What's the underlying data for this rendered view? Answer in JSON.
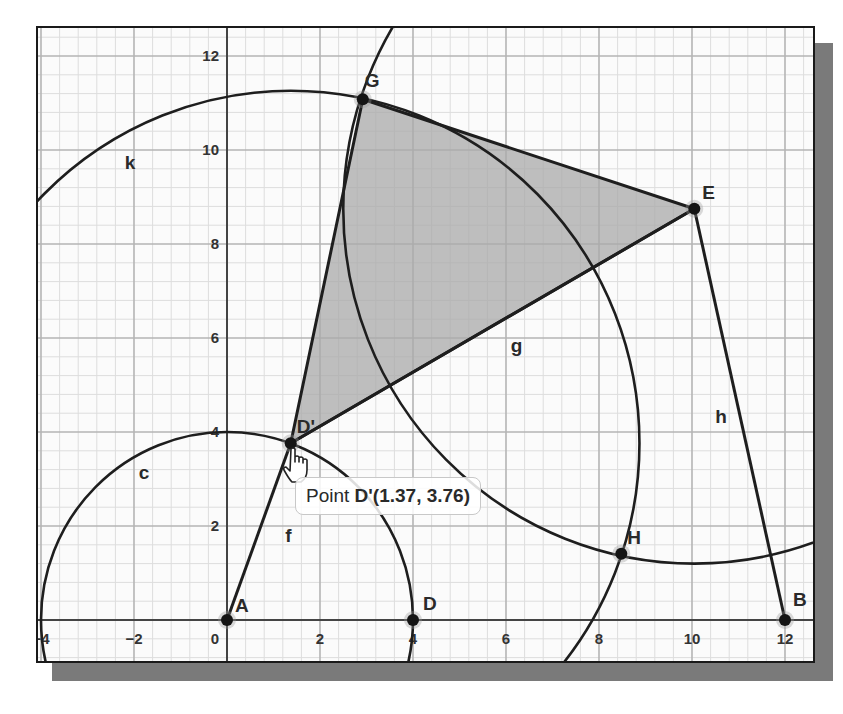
{
  "view": {
    "origin_px": [
      189,
      592
    ],
    "scale_x": 46.5,
    "scale_y": 47,
    "major_step": 2,
    "minor_step": 0.4,
    "x_ticks": [
      "-4",
      "-2",
      "0",
      "2",
      "4",
      "6",
      "8",
      "10",
      "12"
    ],
    "y_ticks": [
      "2",
      "4",
      "6",
      "8",
      "10",
      "12"
    ]
  },
  "colors": {
    "frame": "#1a1a1a",
    "shadow": "#7a7a7a",
    "grid_major": "#b5b5b5",
    "grid_minor": "#dddddd",
    "axis": "#444444",
    "stroke": "#1e1e1e",
    "polygon_fill": "#a9a9a9"
  },
  "points": [
    {
      "name": "A",
      "x": 0,
      "y": 0,
      "label_dx": 8,
      "label_dy": -8
    },
    {
      "name": "B",
      "x": 12,
      "y": 0,
      "label_dx": 8,
      "label_dy": -14
    },
    {
      "name": "D",
      "x": 4,
      "y": 0,
      "label_dx": 10,
      "label_dy": -10
    },
    {
      "name": "D'",
      "x": 1.37,
      "y": 3.76,
      "label_dx": 6,
      "label_dy": -10
    },
    {
      "name": "E",
      "x": 10.05,
      "y": 8.75,
      "label_dx": 8,
      "label_dy": -10
    },
    {
      "name": "G",
      "x": 2.92,
      "y": 11.08,
      "label_dx": 2,
      "label_dy": -12
    },
    {
      "name": "H",
      "x": 8.48,
      "y": 1.41,
      "label_dx": 6,
      "label_dy": -10
    }
  ],
  "segments": [
    {
      "name": "f",
      "from": "A",
      "to": "D'",
      "label_x": 1.25,
      "label_y": 1.65
    },
    {
      "name": "g",
      "from": "D'",
      "to": "E",
      "label_x": 6.1,
      "label_y": 5.7
    },
    {
      "name": "h",
      "from": "E",
      "to": "B",
      "label_x": 10.5,
      "label_y": 4.2
    }
  ],
  "circles": [
    {
      "name": "c",
      "center": "A",
      "r": 4.0,
      "label_x": -1.9,
      "label_y": 3.0
    },
    {
      "name": "k",
      "center": "D'",
      "r": 7.5,
      "label_x": -2.2,
      "label_y": 9.6
    },
    {
      "name": "unnamed-circle-E",
      "center": "E",
      "r": 7.55
    }
  ],
  "polygon": {
    "name": "triangle-GED'",
    "vertices": [
      "G",
      "E",
      "D'"
    ]
  },
  "tooltip": {
    "prefix": "Point ",
    "value": "D'(1.37, 3.76)"
  }
}
